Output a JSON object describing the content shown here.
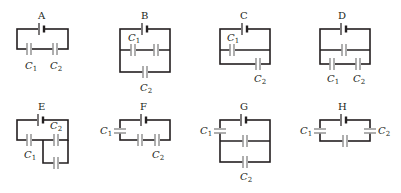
{
  "figure": {
    "colors": {
      "wire": "#231f20",
      "capacitor": "#9a9a9a",
      "background": "#ffffff"
    },
    "circuits": [
      {
        "label": "A",
        "c1": "C",
        "c1_sub": "1",
        "c2": "C",
        "c2_sub": "2",
        "topology": "C1 and C2 in series with battery"
      },
      {
        "label": "B",
        "c1": "C",
        "c1_sub": "1",
        "c2": "C",
        "c2_sub": "2",
        "topology": "C1 in series with unlabeled capacitor, combination parallel to C2"
      },
      {
        "label": "C",
        "c1": "C",
        "c1_sub": "1",
        "c2": "C",
        "c2_sub": "2",
        "topology": "C1 and C2 in parallel branches"
      },
      {
        "label": "D",
        "c1": "C",
        "c1_sub": "1",
        "c2": "C",
        "c2_sub": "2",
        "topology": "unlabeled capacitor parallel to series C1-C2"
      },
      {
        "label": "E",
        "c1": "C",
        "c1_sub": "1",
        "c2": "C",
        "c2_sub": "2",
        "topology": "C1 in series with parallel pair (C2 and unlabeled)"
      },
      {
        "label": "F",
        "c1": "C",
        "c1_sub": "1",
        "c2": "C",
        "c2_sub": "2",
        "topology": "C1, unlabeled capacitor and C2 in series"
      },
      {
        "label": "G",
        "c1": "C",
        "c1_sub": "1",
        "c2": "C",
        "c2_sub": "2",
        "topology": "C1 in series with parallel pair (unlabeled and C2)"
      },
      {
        "label": "H",
        "c1": "C",
        "c1_sub": "1",
        "c2": "C",
        "c2_sub": "2",
        "topology": "C1, unlabeled capacitor and C2 in series"
      }
    ]
  }
}
